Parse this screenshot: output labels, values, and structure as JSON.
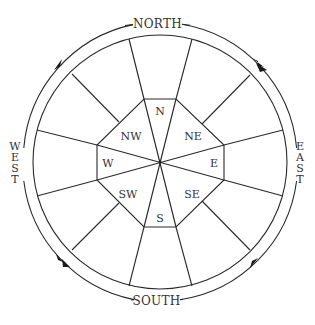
{
  "colors": {
    "line": "#2a2a2a",
    "text": "#333333",
    "background": "#ffffff"
  },
  "cardinal_labels": {
    "north": "NORTH",
    "south": "SOUTH",
    "east": [
      "E",
      "A",
      "S",
      "T"
    ],
    "west": [
      "W",
      "E",
      "S",
      "T"
    ]
  },
  "sector_labels": {
    "n": "N",
    "ne": "NE",
    "e": "E",
    "se": "SE",
    "s": "S",
    "sw": "SW",
    "w": "W",
    "nw": "NW"
  },
  "arrows": [
    {
      "position": "upper-left",
      "direction": "toward-north"
    },
    {
      "position": "upper-right",
      "direction": "toward-north"
    },
    {
      "position": "lower-left",
      "direction": "toward-south"
    },
    {
      "position": "lower-right",
      "direction": "toward-south"
    }
  ],
  "outer_sectors_count": 12
}
